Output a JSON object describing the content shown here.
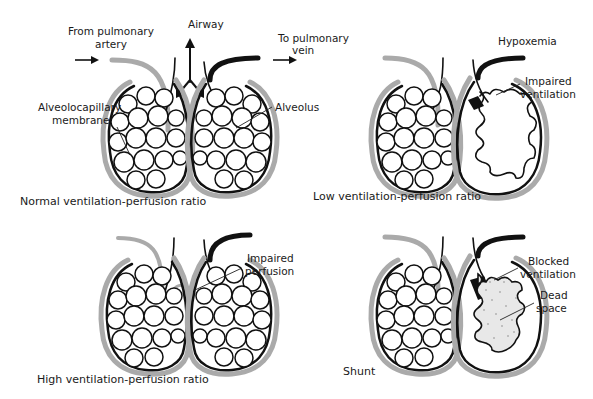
{
  "colors": {
    "ink": "#111111",
    "artery_gray": "#aaaaaa",
    "background": "#ffffff",
    "dead_space_stipple": "#888888"
  },
  "panels": [
    {
      "id": "normal",
      "caption": "Normal ventilation-perfusion ratio",
      "labels": {
        "from_artery_1": "From pulmonary",
        "from_artery_2": "artery",
        "airway": "Airway",
        "to_vein_1": "To pulmonary",
        "to_vein_2": "vein",
        "membrane_1": "Alveolocapillary",
        "membrane_2": "membrane",
        "alveolus": "Alveolus"
      }
    },
    {
      "id": "low",
      "caption": "Low ventilation-perfusion ratio",
      "labels": {
        "hypoxemia": "Hypoxemia",
        "impaired_1": "Impaired",
        "impaired_2": "ventilation"
      }
    },
    {
      "id": "high",
      "caption": "High ventilation-perfusion ratio",
      "labels": {
        "impaired_1": "Impaired",
        "impaired_2": "perfusion"
      }
    },
    {
      "id": "shunt",
      "caption": "Shunt",
      "labels": {
        "blocked_1": "Blocked",
        "blocked_2": "ventilation",
        "dead_1": "Dead",
        "dead_2": "space"
      }
    }
  ]
}
